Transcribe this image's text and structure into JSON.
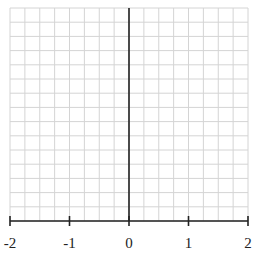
{
  "graph": {
    "x_axis": {
      "min": -2,
      "max": 2,
      "ticks": [
        "-2",
        "-1",
        "0",
        "1",
        "2"
      ],
      "minor_divisions_per_unit": 4
    },
    "y_axis": {
      "visible_rows": 15
    },
    "colors": {
      "grid": "#d4d4d4",
      "axis": "#222222",
      "background": "#ffffff"
    }
  }
}
